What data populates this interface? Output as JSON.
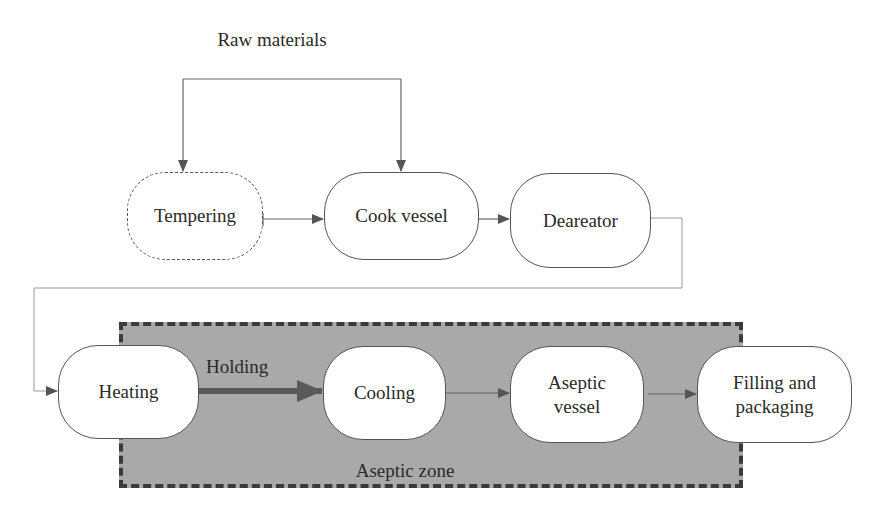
{
  "diagram": {
    "source": {
      "label": "Raw materials"
    },
    "nodes": [
      {
        "id": "tempering",
        "label": "Tempering",
        "style": "dashed"
      },
      {
        "id": "cook-vessel",
        "label": "Cook vessel",
        "style": "solid"
      },
      {
        "id": "deaereator",
        "label": "Deareator",
        "style": "solid"
      },
      {
        "id": "heating",
        "label": "Heating",
        "style": "solid"
      },
      {
        "id": "cooling",
        "label": "Cooling",
        "style": "solid"
      },
      {
        "id": "aseptic-vessel",
        "label": "Aseptic\nvessel",
        "style": "solid"
      },
      {
        "id": "filling-packaging",
        "label": "Filling and\npackaging",
        "style": "solid"
      }
    ],
    "edges": [
      {
        "from": "raw-materials",
        "to": "tempering"
      },
      {
        "from": "raw-materials",
        "to": "cook-vessel"
      },
      {
        "from": "tempering",
        "to": "cook-vessel"
      },
      {
        "from": "cook-vessel",
        "to": "deaereator"
      },
      {
        "from": "deaereator",
        "to": "heating"
      },
      {
        "from": "heating",
        "to": "cooling",
        "label": "Holding",
        "emphasis": "thick"
      },
      {
        "from": "cooling",
        "to": "aseptic-vessel"
      },
      {
        "from": "aseptic-vessel",
        "to": "filling-packaging"
      }
    ],
    "holding_label": "Holding",
    "zone": {
      "label": "Aseptic zone",
      "fill_color": "#a9a9a9",
      "border_color": "#3a3a3a"
    },
    "colors": {
      "node_border": "#555555",
      "arrow": "#555555",
      "text": "#2a2a2a"
    }
  }
}
